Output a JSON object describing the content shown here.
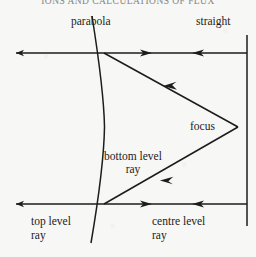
{
  "page": {
    "header_text": "IONS AND CALCULATIONS OF FLUX",
    "background_color": "#f7f7f5",
    "ink_color": "#1c1c1c"
  },
  "figure": {
    "name": "parabolic-reflector-ray-diagram",
    "labels": {
      "parabola": "parabola",
      "straight": "straight",
      "focus": "focus",
      "bottom_level_ray_line1": "bottom level",
      "bottom_level_ray_line2": "ray",
      "top_level_ray_line1": "top level",
      "top_level_ray_line2": "ray",
      "centre_level_ray_line1": "centre level",
      "centre_level_ray_line2": "ray"
    },
    "geometry": {
      "top_ray_y": 53,
      "bottom_ray_y": 204,
      "focus_x": 238,
      "focus_y": 127,
      "straight_line_x": 247,
      "straight_line_top_y": 35,
      "straight_line_bottom_y": 226,
      "parabola_vertex_x": 104,
      "parabola_vertex_y": 127,
      "parabola_top_x": 90,
      "parabola_top_y": 20,
      "parabola_bottom_x": 90,
      "parabola_bottom_y": 240,
      "ray_left_arrow_top_x": 20,
      "ray_left_arrow_bottom_x": 20,
      "right_seg_left_arrow_x": 145,
      "right_seg_right_arrow_x": 200
    }
  }
}
